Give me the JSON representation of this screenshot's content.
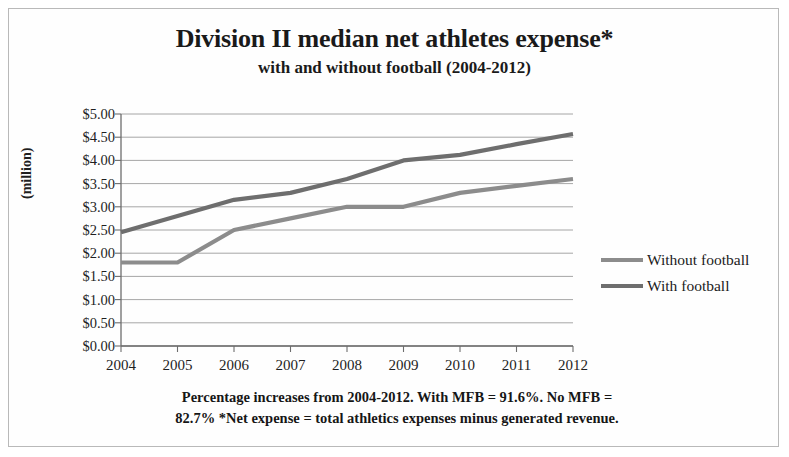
{
  "chart_data": {
    "type": "line",
    "title": "Division II median net athletes expense*",
    "subtitle": "with and without football (2004-2012)",
    "xlabel": "",
    "ylabel": "(million)",
    "categories": [
      "2004",
      "2005",
      "2006",
      "2007",
      "2008",
      "2009",
      "2010",
      "2011",
      "2012"
    ],
    "x": [
      2004,
      2005,
      2006,
      2007,
      2008,
      2009,
      2010,
      2011,
      2012
    ],
    "series": [
      {
        "name": "Without football",
        "color": "#8c8c8c",
        "values": [
          1.8,
          1.8,
          2.5,
          2.75,
          3.0,
          3.0,
          3.3,
          3.45,
          3.6
        ]
      },
      {
        "name": "With football",
        "color": "#6e6e6e",
        "values": [
          2.45,
          2.8,
          3.15,
          3.3,
          3.6,
          4.0,
          4.12,
          4.35,
          4.57
        ]
      }
    ],
    "ylim": [
      0,
      5
    ],
    "ytick_values": [
      0,
      0.5,
      1,
      1.5,
      2,
      2.5,
      3,
      3.5,
      4,
      4.5,
      5
    ],
    "ytick_labels": [
      "$0.00",
      "$0.50",
      "$1.00",
      "$1.50",
      "$2.00",
      "$2.50",
      "$3.00",
      "$3.50",
      "$4.00",
      "$4.50",
      "$5.00"
    ],
    "grid": true,
    "legend_position": "right",
    "annotations": [
      "Percentage increases from 2004-2012. With MFB = 91.6%. No MFB =",
      "82.7% *Net expense = total athletics expenses minus generated revenue."
    ]
  },
  "footnote": {
    "line1": "Percentage increases from 2004-2012. With MFB = 91.6%. No MFB =",
    "line2": "82.7% *Net expense = total athletics expenses minus generated revenue."
  },
  "colors": {
    "without_football": "#8c8c8c",
    "with_football": "#6e6e6e",
    "grid": "#8f8f8f",
    "axis": "#6d6d6d",
    "text": "#1a1a1a",
    "border": "#b9b9b9",
    "background": "#fefefe"
  }
}
